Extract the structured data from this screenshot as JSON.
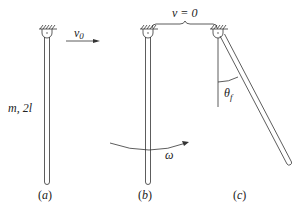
{
  "diagram": {
    "panels": [
      {
        "id": "a",
        "label": "(a)",
        "rod_label": "m, 2l",
        "velocity_label": "v0",
        "velocity_sub": "0"
      },
      {
        "id": "b",
        "label": "(b)",
        "angular_label": "ω"
      },
      {
        "id": "c",
        "label": "(c)",
        "angle_label": "θ",
        "angle_sub": "f"
      }
    ],
    "brace_label": "v = 0",
    "colors": {
      "stroke": "#333333",
      "background": "#ffffff"
    }
  }
}
